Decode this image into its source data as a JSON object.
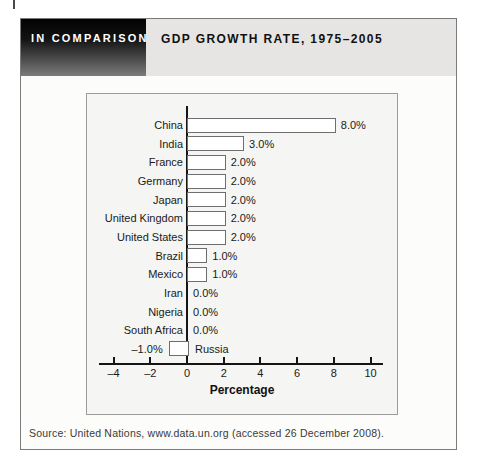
{
  "page": {
    "kicker": "IN COMPARISON",
    "title": "GDP GROWTH RATE, 1975–2005",
    "source": "Source: United Nations, www.data.un.org (accessed 26 December 2008)."
  },
  "chart_data": {
    "type": "bar",
    "orientation": "horizontal",
    "title": "GDP Growth Rate, 1975–2005",
    "categories": [
      "China",
      "India",
      "France",
      "Germany",
      "Japan",
      "United Kingdom",
      "United States",
      "Brazil",
      "Mexico",
      "Iran",
      "Nigeria",
      "South Africa",
      "Russia"
    ],
    "values": [
      8.0,
      3.0,
      2.0,
      2.0,
      2.0,
      2.0,
      2.0,
      1.0,
      1.0,
      0.0,
      0.0,
      0.0,
      -1.0
    ],
    "value_labels": [
      "8.0%",
      "3.0%",
      "2.0%",
      "2.0%",
      "2.0%",
      "2.0%",
      "2.0%",
      "1.0%",
      "1.0%",
      "0.0%",
      "0.0%",
      "0.0%",
      "–1.0%"
    ],
    "xlabel": "Percentage",
    "xlim": [
      -4,
      10
    ],
    "xticks": [
      -4,
      -2,
      0,
      2,
      4,
      6,
      8,
      10
    ],
    "xtick_labels": [
      "–4",
      "–2",
      "0",
      "2",
      "4",
      "6",
      "8",
      "10"
    ],
    "grid": false,
    "legend": null,
    "bar_fill": "#ffffff",
    "bar_border": "#6e6e6e"
  },
  "colors": {
    "header_gradient_top": "#030303",
    "header_gradient_bottom": "#7c7c7c",
    "header_band": "#e6e5e3",
    "chart_background": "#f5f5f3",
    "axis": "#151515",
    "figure_border": "#7a7a7a"
  }
}
